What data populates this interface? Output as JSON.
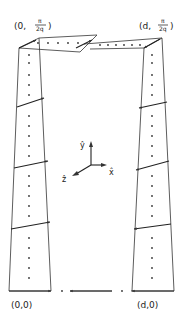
{
  "corner_labels": {
    "top_left": {
      "prefix": "(0,",
      "num": "π",
      "den": "2q",
      "suffix": ")"
    },
    "top_right": {
      "prefix": "(d,",
      "num": "π",
      "den": "2q",
      "suffix": ")"
    },
    "bottom_left": "(0,0)",
    "bottom_right": "(d,0)"
  },
  "axes": {
    "y_label": "ŷ",
    "x_label": "x̂",
    "z_label": "ẑ"
  },
  "colors": {
    "ink": "#333333",
    "background": "#ffffff"
  }
}
